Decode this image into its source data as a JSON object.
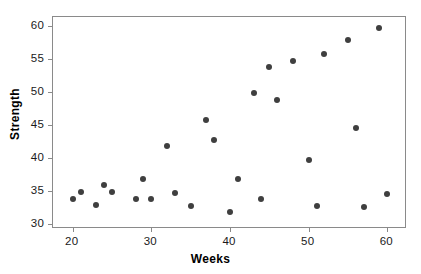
{
  "chart_data": {
    "type": "scatter",
    "title": "",
    "xlabel": "Weeks",
    "ylabel": "Strength",
    "xlim": [
      17.5,
      62.5
    ],
    "ylim": [
      29.3,
      61.3
    ],
    "xticks": [
      20,
      30,
      40,
      50,
      60
    ],
    "yticks": [
      30,
      35,
      40,
      45,
      50,
      55,
      60
    ],
    "grid": false,
    "legend": null,
    "marker": {
      "shape": "circle",
      "color": "#3f3f3f",
      "size": 6
    },
    "series": [
      {
        "name": "Strength vs Weeks",
        "points": [
          {
            "x": 20,
            "y": 33.9
          },
          {
            "x": 21,
            "y": 34.9
          },
          {
            "x": 23,
            "y": 32.9
          },
          {
            "x": 24,
            "y": 35.9
          },
          {
            "x": 25,
            "y": 34.9
          },
          {
            "x": 28,
            "y": 33.9
          },
          {
            "x": 29,
            "y": 36.8
          },
          {
            "x": 30,
            "y": 33.8
          },
          {
            "x": 32,
            "y": 41.8
          },
          {
            "x": 33,
            "y": 34.8
          },
          {
            "x": 35,
            "y": 32.8
          },
          {
            "x": 37,
            "y": 45.7
          },
          {
            "x": 38,
            "y": 42.7
          },
          {
            "x": 40,
            "y": 31.9
          },
          {
            "x": 41,
            "y": 36.8
          },
          {
            "x": 43,
            "y": 49.8
          },
          {
            "x": 44,
            "y": 33.8
          },
          {
            "x": 45,
            "y": 53.8
          },
          {
            "x": 46,
            "y": 48.7
          },
          {
            "x": 48,
            "y": 54.7
          },
          {
            "x": 50,
            "y": 39.7
          },
          {
            "x": 51,
            "y": 32.7
          },
          {
            "x": 52,
            "y": 55.7
          },
          {
            "x": 55,
            "y": 57.8
          },
          {
            "x": 56,
            "y": 44.6
          },
          {
            "x": 57,
            "y": 32.6
          },
          {
            "x": 59,
            "y": 59.7
          },
          {
            "x": 60,
            "y": 34.6
          }
        ]
      }
    ]
  },
  "axes": {
    "x_title": "Weeks",
    "y_title": "Strength",
    "x_tick_labels": [
      "20",
      "30",
      "40",
      "50",
      "60"
    ],
    "y_tick_labels": [
      "30",
      "35",
      "40",
      "45",
      "50",
      "55",
      "60"
    ]
  },
  "colors": {
    "marker": "#3f3f3f",
    "frame": "#8a8a8a",
    "text": "#000000",
    "background": "#ffffff"
  }
}
